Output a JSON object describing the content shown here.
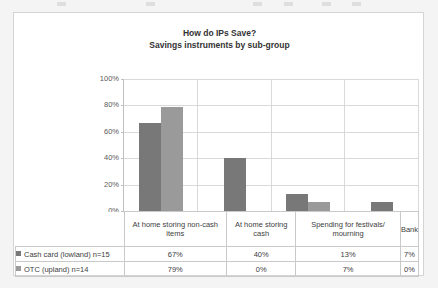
{
  "chart_data": {
    "type": "bar",
    "title": "How do IPs Save?",
    "subtitle": "Savings instruments by sub-group",
    "xlabel": "",
    "ylabel": "",
    "ylim": [
      0,
      100
    ],
    "ytick_labels": [
      "100%",
      "80%",
      "60%",
      "40%",
      "20%",
      "0%"
    ],
    "ytick_values": [
      100,
      80,
      60,
      40,
      20,
      0
    ],
    "grid": true,
    "legend_position": "table-below",
    "categories": [
      "At home storing non-cash items",
      "At home storing cash",
      "Spending for festivals/ mourning",
      "Bank"
    ],
    "series": [
      {
        "name": "Cash card (lowland) n=15",
        "color": "#787878",
        "values": [
          67,
          40,
          13,
          7
        ],
        "value_labels": [
          "67%",
          "40%",
          "13%",
          "7%"
        ]
      },
      {
        "name": "OTC (upland) n=14",
        "color": "#9a9a9a",
        "values": [
          79,
          0,
          7,
          0
        ],
        "value_labels": [
          "79%",
          "0%",
          "7%",
          "0%"
        ]
      }
    ]
  },
  "panel": {
    "background": "#ffffff",
    "border_color": "#d4d4d4",
    "page_background": "#f4f4f4"
  }
}
